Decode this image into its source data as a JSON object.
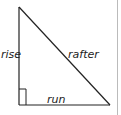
{
  "diagram": {
    "type": "right-triangle",
    "labels": {
      "vertical_leg": "rise",
      "hypotenuse": "rafter",
      "horizontal_leg": "run"
    },
    "colors": {
      "stroke": "#222222",
      "border": "#bbbbbb",
      "background": "#ffffff"
    }
  }
}
